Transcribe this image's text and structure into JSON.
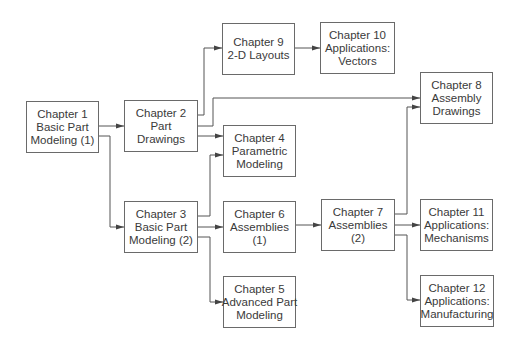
{
  "diagram": {
    "type": "flowchart",
    "line_color": "#555555",
    "box_border_color": "#6a6a6a",
    "text_color": "#3a3a3a",
    "nodes": {
      "ch1": {
        "line1": "Chapter 1",
        "line2": "Basic Part",
        "line3": "Modeling (1)"
      },
      "ch2": {
        "line1": "Chapter 2",
        "line2": "Part",
        "line3": "Drawings"
      },
      "ch3": {
        "line1": "Chapter 3",
        "line2": "Basic Part",
        "line3": "Modeling (2)"
      },
      "ch4": {
        "line1": "Chapter 4",
        "line2": "Parametric",
        "line3": "Modeling"
      },
      "ch5": {
        "line1": "Chapter 5",
        "line2": "Advanced Part",
        "line3": "Modeling"
      },
      "ch6": {
        "line1": "Chapter 6",
        "line2": "Assemblies",
        "line3": "(1)"
      },
      "ch7": {
        "line1": "Chapter 7",
        "line2": "Assemblies",
        "line3": "(2)"
      },
      "ch8": {
        "line1": "Chapter 8",
        "line2": "Assembly",
        "line3": "Drawings"
      },
      "ch9": {
        "line1": "Chapter 9",
        "line2": "2-D Layouts"
      },
      "ch10": {
        "line1": "Chapter 10",
        "line2": "Applications:",
        "line3": "Vectors"
      },
      "ch11": {
        "line1": "Chapter 11",
        "line2": "Applications:",
        "line3": "Mechanisms"
      },
      "ch12": {
        "line1": "Chapter 12",
        "line2": "Applications:",
        "line3": "Manufacturing"
      }
    },
    "edges": [
      {
        "from": "ch1",
        "to": "ch2"
      },
      {
        "from": "ch1",
        "to": "ch3"
      },
      {
        "from": "ch2",
        "to": "ch9"
      },
      {
        "from": "ch2",
        "to": "ch8"
      },
      {
        "from": "ch2",
        "to": "ch4"
      },
      {
        "from": "ch9",
        "to": "ch10"
      },
      {
        "from": "ch3",
        "to": "ch4"
      },
      {
        "from": "ch3",
        "to": "ch6"
      },
      {
        "from": "ch3",
        "to": "ch5"
      },
      {
        "from": "ch6",
        "to": "ch7"
      },
      {
        "from": "ch7",
        "to": "ch8"
      },
      {
        "from": "ch7",
        "to": "ch11"
      },
      {
        "from": "ch7",
        "to": "ch12"
      }
    ]
  }
}
